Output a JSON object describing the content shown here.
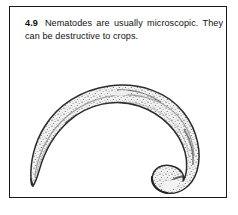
{
  "figure": {
    "number": "4.9",
    "caption_text": "Nematodes are usually microscopic. They can be destructive to crops.",
    "caption_full": "4.9  Nematodes are usually microscopic. They can be destructive to crops.",
    "frame_color": "#1a1a1a",
    "background_color": "#ffffff",
    "text_color": "#111111"
  },
  "illustration": {
    "subject": "nematode",
    "description": "Line-drawing of a single nematode worm curved into a broad arc opening toward the lower left; thin tapered tail at the left end and a thicker blunt rounded head curling inward at the lower right. Body is rendered with fine stippled and hatched shading.",
    "ink_color": "#2b2b2b",
    "shading_color": "#777777",
    "parts": {
      "tail_label": "tail",
      "head_label": "head",
      "body_label": "body"
    }
  }
}
